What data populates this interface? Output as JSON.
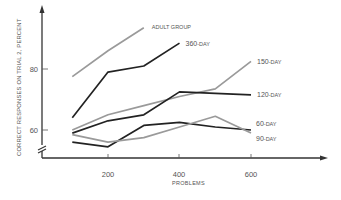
{
  "chart_data": {
    "type": "line",
    "title": "",
    "xlabel": "PROBLEMS",
    "ylabel": "CORRECT RESPONSES ON TRIAL 2, PERCENT",
    "x_ticks": [
      200,
      400,
      600
    ],
    "y_ticks": [
      60,
      80
    ],
    "xlim": [
      0,
      700
    ],
    "ylim": [
      50,
      100
    ],
    "y_axis_break": true,
    "grid": false,
    "legend_position": "inline-labels-at-line-ends",
    "x": [
      100,
      200,
      300,
      400,
      500,
      600
    ],
    "series": [
      {
        "name": "ADULT GROUP",
        "color": "#9a9a9a",
        "x": [
          100,
          200,
          300
        ],
        "values": [
          77.5,
          86,
          93.5
        ]
      },
      {
        "name": "360 DAY",
        "color": "#222222",
        "x": [
          100,
          200,
          300,
          400
        ],
        "values": [
          64,
          79,
          81,
          88.5
        ]
      },
      {
        "name": "150 DAY",
        "color": "#9a9a9a",
        "x": [
          100,
          200,
          300,
          400,
          500,
          600
        ],
        "values": [
          60,
          65,
          68,
          71,
          73.5,
          82.5
        ]
      },
      {
        "name": "120 DAY",
        "color": "#222222",
        "x": [
          100,
          200,
          300,
          400,
          500,
          600
        ],
        "values": [
          59,
          63,
          65,
          72.5,
          72,
          71.5
        ]
      },
      {
        "name": "60 DAY",
        "color": "#222222",
        "x": [
          100,
          200,
          300,
          400,
          500,
          600
        ],
        "values": [
          56,
          54.5,
          61.5,
          62.5,
          61,
          60
        ]
      },
      {
        "name": "90 DAY",
        "color": "#9a9a9a",
        "x": [
          100,
          200,
          300,
          400,
          500,
          600
        ],
        "values": [
          58.5,
          56,
          57.5,
          61,
          64.5,
          59
        ]
      }
    ]
  },
  "labels": {
    "ytick_80": "80",
    "ytick_60": "60",
    "xtick_200": "200",
    "xtick_400": "400",
    "xtick_600": "600"
  }
}
